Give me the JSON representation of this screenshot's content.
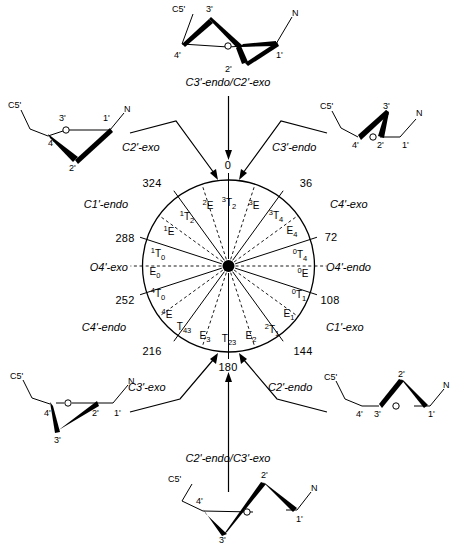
{
  "figure": {
    "circle": {
      "cx": 228.5,
      "cy": 266,
      "r": 86,
      "hub_r": 6
    }
  },
  "wheel": {
    "angle_ticks": [
      {
        "value": "0",
        "deg": 0,
        "x": 228,
        "y": 166
      },
      {
        "value": "36",
        "deg": 36,
        "x": 306,
        "y": 184
      },
      {
        "value": "72",
        "deg": 72,
        "x": 331,
        "y": 238
      },
      {
        "value": "108",
        "deg": 108,
        "x": 330,
        "y": 301
      },
      {
        "value": "144",
        "deg": 144,
        "x": 303,
        "y": 352
      },
      {
        "value": "180",
        "deg": 180,
        "x": 228,
        "y": 368
      },
      {
        "value": "216",
        "deg": 216,
        "x": 152,
        "y": 352
      },
      {
        "value": "252",
        "deg": 252,
        "x": 125,
        "y": 301
      },
      {
        "value": "288",
        "deg": 288,
        "x": 125,
        "y": 239
      },
      {
        "value": "324",
        "deg": 324,
        "x": 152,
        "y": 184
      }
    ],
    "outer_labels": [
      {
        "text": "C4'-exo",
        "x": 330,
        "y": 205,
        "align": "left"
      },
      {
        "text": "O4'-endo",
        "x": 326,
        "y": 268,
        "align": "left"
      },
      {
        "text": "C1'-exo",
        "x": 326,
        "y": 328,
        "align": "left"
      },
      {
        "text": "C4'-endo",
        "x": 126,
        "y": 328,
        "align": "right"
      },
      {
        "text": "O4'-exo",
        "x": 128,
        "y": 268,
        "align": "right"
      },
      {
        "text": "C1'-endo",
        "x": 128,
        "y": 205,
        "align": "right"
      }
    ],
    "conformers": [
      {
        "pre": "3",
        "main": "T",
        "post": "2",
        "deg": 0,
        "x": 229,
        "y": 203
      },
      {
        "pre": "3",
        "main": "E",
        "post": "",
        "deg": 18,
        "x": 254,
        "y": 206
      },
      {
        "pre": "3",
        "main": "T",
        "post": "4",
        "deg": 36,
        "x": 276,
        "y": 216
      },
      {
        "pre": "",
        "main": "E",
        "post": "4",
        "deg": 54,
        "x": 292,
        "y": 233
      },
      {
        "pre": "0",
        "main": "T",
        "post": "4",
        "deg": 72,
        "x": 300,
        "y": 255
      },
      {
        "pre": "0",
        "main": "E",
        "post": "",
        "deg": 90,
        "x": 303,
        "y": 274
      },
      {
        "pre": "0",
        "main": "T",
        "post": "1",
        "deg": 108,
        "x": 299,
        "y": 295
      },
      {
        "pre": "",
        "main": "E",
        "post": "1",
        "deg": 126,
        "x": 289,
        "y": 316
      },
      {
        "pre": "2",
        "main": "T",
        "post": "1",
        "deg": 144,
        "x": 272,
        "y": 330
      },
      {
        "pre": "",
        "main": "E",
        "post": "2",
        "deg": 162,
        "x": 251,
        "y": 338
      },
      {
        "pre": "",
        "main": "T",
        "post": "23",
        "deg": 180,
        "x": 229,
        "y": 341
      },
      {
        "pre": "",
        "main": "E",
        "post": "3",
        "deg": 198,
        "x": 205,
        "y": 338
      },
      {
        "pre": "",
        "main": "T",
        "post": "43",
        "deg": 216,
        "x": 184,
        "y": 329
      },
      {
        "pre": "4",
        "main": "E",
        "post": "",
        "deg": 234,
        "x": 167,
        "y": 315
      },
      {
        "pre": "4",
        "main": "T",
        "post": "0",
        "deg": 252,
        "x": 158,
        "y": 294
      },
      {
        "pre": "",
        "main": "E",
        "post": "0",
        "deg": 270,
        "x": 155,
        "y": 274
      },
      {
        "pre": "1",
        "main": "T",
        "post": "0",
        "deg": 288,
        "x": 158,
        "y": 254
      },
      {
        "pre": "1",
        "main": "E",
        "post": "",
        "deg": 306,
        "x": 169,
        "y": 232
      },
      {
        "pre": "1",
        "main": "T",
        "post": "2",
        "deg": 324,
        "x": 187,
        "y": 217
      },
      {
        "pre": "2",
        "main": "E",
        "post": "",
        "deg": 342,
        "x": 208,
        "y": 206
      }
    ]
  },
  "callouts": [
    {
      "name": "c2-exo",
      "text": "C2'-exo",
      "x": 122,
      "y": 148,
      "align": "left"
    },
    {
      "name": "c3-endo",
      "text": "C3'-endo",
      "x": 272,
      "y": 148,
      "align": "left"
    },
    {
      "name": "c3-exo",
      "text": "C3'-exo",
      "x": 128,
      "y": 388,
      "align": "left"
    },
    {
      "name": "c2-endo",
      "text": "C2'-endo",
      "x": 268,
      "y": 388,
      "align": "left"
    }
  ],
  "structures": {
    "top": {
      "caption": "C3'-endo/C2'-exo",
      "atoms": {
        "c5": "C5'",
        "n": "N",
        "a4": "4'",
        "a3": "3'",
        "a2": "2'",
        "a1": "1'",
        "o": "O"
      }
    },
    "upper_left": {
      "caption": "",
      "atoms": {
        "c5": "C5'",
        "n": "N",
        "a4": "4'",
        "a3": "3'",
        "a2": "2'",
        "a1": "1'",
        "o": "O"
      }
    },
    "upper_right": {
      "caption": "",
      "atoms": {
        "c5": "C5'",
        "n": "N",
        "a4": "4'",
        "a3": "3'",
        "a2": "2'",
        "a1": "1'",
        "o": "O"
      }
    },
    "lower_left": {
      "caption": "",
      "atoms": {
        "c5": "C5'",
        "n": "N",
        "a4": "4'",
        "a3": "3'",
        "a2": "2'",
        "a1": "1'",
        "o": "O"
      }
    },
    "lower_right": {
      "caption": "",
      "atoms": {
        "c5": "C5'",
        "n": "N",
        "a4": "4'",
        "a3": "3'",
        "a2": "2'",
        "a1": "1'",
        "o": "O"
      }
    },
    "bottom": {
      "caption": "C2'-endo/C3'-exo",
      "atoms": {
        "c5": "C5'",
        "n": "N",
        "a4": "4'",
        "a3": "3'",
        "a2": "2'",
        "a1": "1'",
        "o": "O"
      }
    }
  },
  "colors": {
    "stroke": "#000000",
    "background": "#ffffff"
  }
}
